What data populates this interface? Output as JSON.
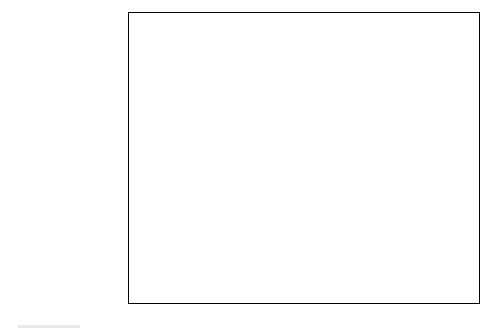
{
  "chart_data": {
    "type": "bar",
    "orientation": "horizontal",
    "title": "",
    "xlabel": "",
    "ylabel": "",
    "xlim": [
      0,
      35
    ],
    "xticks": [
      "0%",
      "5%",
      "10%",
      "15%",
      "20%",
      "25%",
      "30%",
      "35%"
    ],
    "xtick_values": [
      0,
      5,
      10,
      15,
      20,
      25,
      30,
      35
    ],
    "grid": "vertical",
    "legend_position": "bottom-right",
    "categories": [
      "Private settlement",
      "Fear of bad publicity",
      "Other",
      "Too costly",
      "Victim wanted closure",
      "Internal discipline\nsufficient",
      "Don't know",
      "Perp locked assets",
      "Gov't declined to\nprosecute",
      "Lack of evidence",
      "Fear of countersuit",
      "Perp disappeared"
    ],
    "series": [
      {
        "name": "2004",
        "color": "#6e6e6e",
        "values": [
          26.6,
          26.1,
          20.2,
          19.7,
          17.4,
          15.6,
          13.8,
          11.0,
          9.2,
          9.2,
          6.0,
          1.4
        ],
        "labels": [
          "26.6%",
          "26.1%",
          "20.2%",
          "19.7%",
          "17.4%",
          "15.6%",
          "13.8%",
          "11.0%",
          "9.2%",
          "9.2%",
          "6.0%",
          "1.4%"
        ]
      },
      {
        "name": "2002",
        "color": "#111111",
        "values": [
          26.6,
          30.6,
          9.3,
          14.9,
          25.8,
          21.4,
          6.9,
          15.3,
          19.0,
          8.1,
          5.2,
          0.4
        ],
        "labels": [
          "26.6%",
          "30.6%",
          "9.3%",
          "14.9%",
          "25.8%",
          "21.4%",
          "6.9%",
          "15.3%",
          "19.0%",
          "8.1%",
          "5.2%",
          "0.4%"
        ]
      }
    ]
  },
  "legend": {
    "items": [
      {
        "label": "2004",
        "color": "#6e6e6e"
      },
      {
        "label": "2002",
        "color": "#111111"
      }
    ]
  }
}
